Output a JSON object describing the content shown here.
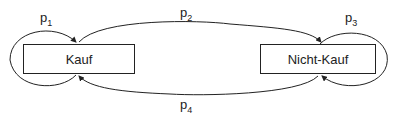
{
  "diagram": {
    "type": "state-transition",
    "states": [
      {
        "id": "kauf",
        "label": "Kauf"
      },
      {
        "id": "nicht_kauf",
        "label": "Nicht-Kauf"
      }
    ],
    "transitions": [
      {
        "from": "kauf",
        "to": "kauf",
        "label_base": "p",
        "label_sub": "1"
      },
      {
        "from": "kauf",
        "to": "nicht_kauf",
        "label_base": "p",
        "label_sub": "2"
      },
      {
        "from": "nicht_kauf",
        "to": "nicht_kauf",
        "label_base": "p",
        "label_sub": "3"
      },
      {
        "from": "nicht_kauf",
        "to": "kauf",
        "label_base": "p",
        "label_sub": "4"
      }
    ],
    "colors": {
      "stroke": "#222222",
      "background": "#ffffff"
    }
  }
}
